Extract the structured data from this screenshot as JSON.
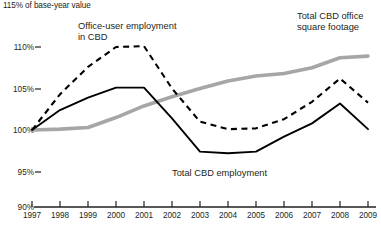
{
  "chart_data": {
    "type": "line",
    "title": "",
    "xlabel": "",
    "ylabel": "115% of base-year value",
    "ylim": [
      90,
      115
    ],
    "yticks": [
      115,
      110,
      105,
      100,
      95,
      90
    ],
    "ytick_labels": [
      "115%",
      "110%",
      "105%",
      "100%",
      "95%",
      "90%"
    ],
    "grid": false,
    "legend_position": "inline-annotations",
    "x": [
      1997,
      1998,
      1999,
      2000,
      2001,
      2002,
      2003,
      2004,
      2005,
      2006,
      2007,
      2008,
      2009
    ],
    "xtick_labels": [
      "1997",
      "1998",
      "1999",
      "2000",
      "2001",
      "2002",
      "2003",
      "2004",
      "2005",
      "2006",
      "2007",
      "2008",
      "2009"
    ],
    "series": [
      {
        "name": "Office-user employment in CBD",
        "style": "dashed",
        "color": "#000000",
        "values": [
          100.0,
          104.3,
          107.6,
          110.0,
          110.1,
          105.0,
          101.0,
          100.1,
          100.2,
          101.3,
          103.4,
          106.2,
          103.3
        ]
      },
      {
        "name": "Total CBD employment",
        "style": "solid",
        "color": "#000000",
        "values": [
          100.0,
          102.4,
          103.9,
          105.1,
          105.1,
          101.4,
          97.4,
          97.2,
          97.4,
          99.2,
          100.8,
          103.2,
          100.1
        ]
      },
      {
        "name": "Total CBD office square footage",
        "style": "solid-thick",
        "color": "#a6a6a6",
        "values": [
          100.0,
          100.1,
          100.3,
          101.5,
          102.9,
          104.0,
          105.0,
          105.9,
          106.5,
          106.8,
          107.5,
          108.7,
          108.9
        ]
      }
    ],
    "annotations": [
      {
        "name": "office-user-employment-label",
        "line1": "Office-user employment",
        "line2": "in CBD"
      },
      {
        "name": "total-cbd-office-sqft-label",
        "line1": "Total CBD office",
        "line2": "square footage"
      },
      {
        "name": "total-cbd-employment-label",
        "line1": "Total CBD employment",
        "line2": ""
      }
    ]
  }
}
